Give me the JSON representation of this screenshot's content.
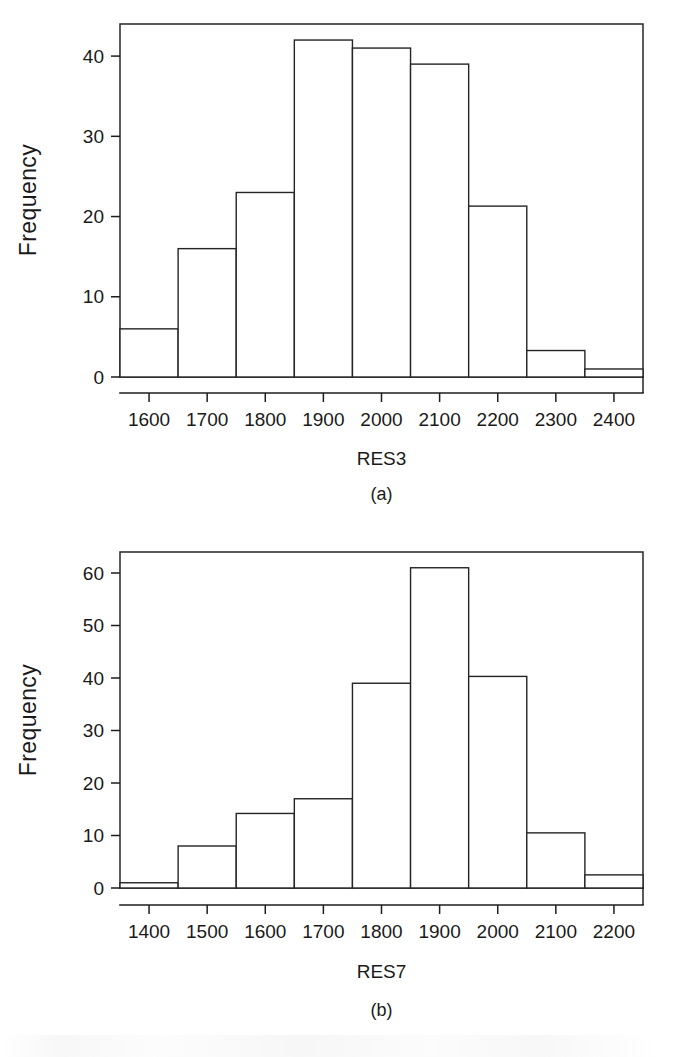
{
  "figure": {
    "background_color": "#ffffff",
    "ink_color": "#1a1a1a",
    "panels": [
      {
        "caption": "(a)",
        "y_axis_title": "Frequency",
        "x_axis_title": "RES3"
      },
      {
        "caption": "(b)",
        "y_axis_title": "Frequency",
        "x_axis_title": "RES7"
      }
    ]
  },
  "chart_data": [
    {
      "type": "bar",
      "title": "",
      "subtitle": "",
      "panel_label": "(a)",
      "xlabel": "RES3",
      "ylabel": "Frequency",
      "x_tick_labels": [
        "1600",
        "1700",
        "1800",
        "1900",
        "2000",
        "2100",
        "2200",
        "2300",
        "2400"
      ],
      "x_ticks": [
        1600,
        1700,
        1800,
        1900,
        2000,
        2100,
        2200,
        2300,
        2400
      ],
      "y_tick_labels": [
        "0",
        "10",
        "20",
        "30",
        "40"
      ],
      "y_ticks": [
        0,
        10,
        20,
        30,
        40
      ],
      "xlim": [
        1550,
        2450
      ],
      "ylim": [
        0,
        44
      ],
      "bin_width": 100,
      "bin_edges": [
        1550,
        1650,
        1750,
        1850,
        1950,
        2050,
        2150,
        2250,
        2350,
        2450
      ],
      "categories": [
        "1550-1650",
        "1650-1750",
        "1750-1850",
        "1850-1950",
        "1950-2050",
        "2050-2150",
        "2150-2250",
        "2250-2350",
        "2350-2450"
      ],
      "values": [
        6,
        16,
        23,
        42,
        41,
        39,
        21.3,
        3.3,
        1
      ],
      "grid": false,
      "legend": "none"
    },
    {
      "type": "bar",
      "title": "",
      "subtitle": "",
      "panel_label": "(b)",
      "xlabel": "RES7",
      "ylabel": "Frequency",
      "x_tick_labels": [
        "1400",
        "1500",
        "1600",
        "1700",
        "1800",
        "1900",
        "2000",
        "2100",
        "2200"
      ],
      "x_ticks": [
        1400,
        1500,
        1600,
        1700,
        1800,
        1900,
        2000,
        2100,
        2200
      ],
      "y_tick_labels": [
        "0",
        "10",
        "20",
        "30",
        "40",
        "50",
        "60"
      ],
      "y_ticks": [
        0,
        10,
        20,
        30,
        40,
        50,
        60
      ],
      "xlim": [
        1350,
        2250
      ],
      "ylim": [
        0,
        64
      ],
      "bin_width": 100,
      "bin_edges": [
        1350,
        1450,
        1550,
        1650,
        1750,
        1850,
        1950,
        2050,
        2150,
        2250
      ],
      "categories": [
        "1350-1450",
        "1450-1550",
        "1550-1650",
        "1650-1750",
        "1750-1850",
        "1850-1950",
        "1950-2050",
        "2050-2150",
        "2150-2250"
      ],
      "values": [
        1,
        8,
        14.2,
        17,
        39,
        61,
        40.3,
        10.5,
        2.5
      ],
      "grid": false,
      "legend": "none"
    }
  ]
}
